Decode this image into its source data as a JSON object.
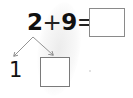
{
  "equation": {
    "addend1": "2",
    "operator": "+",
    "addend2": "9",
    "equals": "=",
    "answer": ""
  },
  "decomposition": {
    "known_part": "1",
    "unknown_part": ""
  },
  "colors": {
    "text": "#111111",
    "box_border": "#8a8a8a",
    "arrow": "#888888",
    "background": "#ffffff"
  }
}
